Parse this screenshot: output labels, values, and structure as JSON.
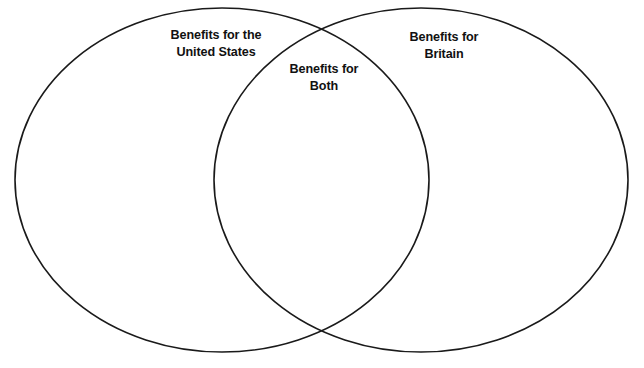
{
  "diagram": {
    "type": "venn",
    "title": "",
    "background_color": "#ffffff",
    "stroke_color": "#1a1a1a",
    "text_color": "#111111",
    "sets": [
      {
        "id": "left",
        "label": "Benefits for the\nUnited States",
        "label_line_1": "Benefits for the",
        "label_line_2": "United States",
        "cx": 222,
        "cy": 180,
        "rx": 207,
        "ry": 172
      },
      {
        "id": "right",
        "label": "Benefits for\nBritain",
        "label_line_1": "Benefits for",
        "label_line_2": "Britain",
        "cx": 421,
        "cy": 180,
        "rx": 207,
        "ry": 172
      }
    ],
    "intersection": {
      "id": "both",
      "label": "Benefits for\nBoth",
      "label_line_1": "Benefits for",
      "label_line_2": "Both"
    }
  }
}
